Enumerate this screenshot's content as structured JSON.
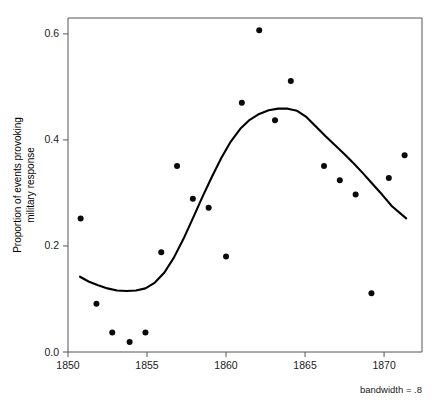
{
  "chart_data": {
    "type": "scatter",
    "title": "",
    "xlabel": "",
    "ylabel": "Proportion of events provoking military response",
    "ylabel_line1": "Proportion of events provoking",
    "ylabel_line2": "military response",
    "xlim": [
      1850.0,
      1872.4
    ],
    "ylim": [
      0.0,
      0.63
    ],
    "xticks": [
      1850,
      1855,
      1860,
      1865,
      1870
    ],
    "xtick_labels": [
      "1850",
      "1855",
      "1860",
      "1865",
      "1870"
    ],
    "yticks": [
      0.0,
      0.2,
      0.4,
      0.6
    ],
    "ytick_labels": [
      "0.0",
      "0.2",
      "0.4",
      "0.6"
    ],
    "grid": false,
    "legend": null,
    "annotation": "bandwidth = .8",
    "annotation_position": "bottom-right",
    "point_color": "#0a0a0a",
    "curve_color": "#000000",
    "axis_color": "#555555",
    "points": [
      {
        "x": 1850.8,
        "y": 0.252
      },
      {
        "x": 1851.8,
        "y": 0.091
      },
      {
        "x": 1852.8,
        "y": 0.037
      },
      {
        "x": 1853.9,
        "y": 0.019
      },
      {
        "x": 1854.9,
        "y": 0.037
      },
      {
        "x": 1855.9,
        "y": 0.188
      },
      {
        "x": 1856.9,
        "y": 0.351
      },
      {
        "x": 1857.9,
        "y": 0.289
      },
      {
        "x": 1858.9,
        "y": 0.272
      },
      {
        "x": 1860.0,
        "y": 0.18
      },
      {
        "x": 1861.0,
        "y": 0.47
      },
      {
        "x": 1862.1,
        "y": 0.607
      },
      {
        "x": 1863.1,
        "y": 0.437
      },
      {
        "x": 1864.1,
        "y": 0.511
      },
      {
        "x": 1866.2,
        "y": 0.351
      },
      {
        "x": 1867.2,
        "y": 0.324
      },
      {
        "x": 1868.2,
        "y": 0.297
      },
      {
        "x": 1869.2,
        "y": 0.111
      },
      {
        "x": 1870.3,
        "y": 0.328
      },
      {
        "x": 1871.3,
        "y": 0.371
      }
    ],
    "smooth_curve": {
      "label": "lowess smoother",
      "bandwidth": 0.8,
      "x": [
        1850.76,
        1851.3,
        1851.9,
        1852.5,
        1853.1,
        1853.7,
        1854.3,
        1854.9,
        1855.5,
        1856.1,
        1856.7,
        1857.3,
        1857.9,
        1858.5,
        1859.1,
        1859.7,
        1860.3,
        1860.9,
        1861.5,
        1862.1,
        1862.7,
        1863.3,
        1863.9,
        1864.5,
        1865.1,
        1865.7,
        1866.3,
        1866.9,
        1867.5,
        1868.1,
        1868.7,
        1869.3,
        1869.9,
        1870.5,
        1871.4
      ],
      "y": [
        0.142,
        0.133,
        0.126,
        0.12,
        0.116,
        0.115,
        0.116,
        0.12,
        0.131,
        0.15,
        0.178,
        0.213,
        0.252,
        0.292,
        0.33,
        0.366,
        0.397,
        0.421,
        0.438,
        0.449,
        0.456,
        0.459,
        0.459,
        0.455,
        0.443,
        0.425,
        0.407,
        0.39,
        0.373,
        0.355,
        0.336,
        0.316,
        0.296,
        0.275,
        0.252
      ]
    }
  },
  "plot_area": {
    "left_px": 68,
    "right_px": 422,
    "top_px": 18,
    "bottom_px": 352
  }
}
